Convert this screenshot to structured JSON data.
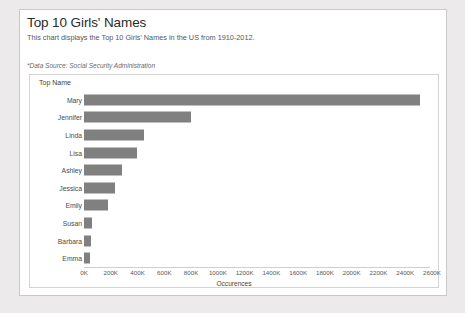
{
  "report": {
    "title": "Top 10 Girls' Names",
    "subtitle": "This chart displays the Top 10 Girls' Names in the US from 1910-2012.",
    "source_note": "*Data Source: Social Security Administration"
  },
  "colors": {
    "bar": "#808080",
    "panel_border": "#c9c9c9",
    "plot_border": "#d4d4d4",
    "page_background": "#eceaea"
  },
  "chart_data": {
    "type": "bar",
    "orientation": "horizontal",
    "title": "Top 10 Girls' Names",
    "subtitle": "This chart displays the Top 10 Girls' Names in the US from 1910-2012.",
    "xlabel": "Occurences",
    "ylabel": "Top Name",
    "categories": [
      "Mary",
      "Jennifer",
      "Linda",
      "Lisa",
      "Ashley",
      "Jessica",
      "Emily",
      "Susan",
      "Barbara",
      "Emma"
    ],
    "values": [
      2510000,
      800000,
      445000,
      395000,
      285000,
      235000,
      180000,
      60000,
      50000,
      45000
    ],
    "xlim": [
      0,
      2600000
    ],
    "xticks": [
      0,
      200000,
      400000,
      600000,
      800000,
      1000000,
      1200000,
      1400000,
      1600000,
      1800000,
      2000000,
      2200000,
      2400000,
      2600000
    ],
    "xtick_labels": [
      "0K",
      "200K",
      "400K",
      "600K",
      "800K",
      "1000K",
      "1200K",
      "1400K",
      "1600K",
      "1800K",
      "2000K",
      "2200K",
      "2400K",
      "2600K"
    ],
    "grid": false,
    "legend": false
  }
}
